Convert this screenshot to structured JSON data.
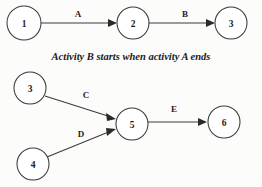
{
  "diagram": {
    "caption": "Activity B starts when activity A ends",
    "background_color": "#fcfcfb",
    "stroke_color": "#3a3a3a",
    "text_color": "#1c1c1c",
    "top_graph": {
      "name": "sequential-activities",
      "nodes": [
        {
          "id": "n1",
          "label": "1",
          "cx": 24,
          "cy": 23,
          "r": 17
        },
        {
          "id": "n2",
          "label": "2",
          "cx": 133,
          "cy": 23,
          "r": 16
        },
        {
          "id": "n3",
          "label": "3",
          "cx": 231,
          "cy": 23,
          "r": 16
        }
      ],
      "edges": [
        {
          "id": "e-a",
          "label": "A",
          "from": "n1",
          "to": "n2",
          "x1": 41,
          "y1": 23,
          "x2": 117,
          "y2": 23,
          "label_x": 78,
          "label_y": 14
        },
        {
          "id": "e-b",
          "label": "B",
          "from": "n2",
          "to": "n3",
          "x1": 149,
          "y1": 23,
          "x2": 215,
          "y2": 23,
          "label_x": 185,
          "label_y": 14
        }
      ]
    },
    "bottom_graph": {
      "name": "converging-activities",
      "nodes": [
        {
          "id": "n3b",
          "label": "3",
          "cx": 30,
          "cy": 88,
          "r": 16
        },
        {
          "id": "n4",
          "label": "4",
          "cx": 33,
          "cy": 164,
          "r": 16
        },
        {
          "id": "n5",
          "label": "5",
          "cx": 132,
          "cy": 124,
          "r": 16
        },
        {
          "id": "n6",
          "label": "6",
          "cx": 224,
          "cy": 122,
          "r": 16
        }
      ],
      "edges": [
        {
          "id": "e-c",
          "label": "C",
          "from": "n3b",
          "to": "n5",
          "x1": 45,
          "y1": 96,
          "x2": 114,
          "y2": 118,
          "label_x": 86,
          "label_y": 95
        },
        {
          "id": "e-d",
          "label": "D",
          "from": "n4",
          "to": "n5",
          "x1": 47,
          "y1": 157,
          "x2": 114,
          "y2": 130,
          "label_x": 81,
          "label_y": 134
        },
        {
          "id": "e-e",
          "label": "E",
          "from": "n5",
          "to": "n6",
          "x1": 148,
          "y1": 122,
          "x2": 207,
          "y2": 122,
          "label_x": 174,
          "label_y": 109
        }
      ]
    },
    "caption_position": {
      "x": 131,
      "y": 55
    }
  }
}
